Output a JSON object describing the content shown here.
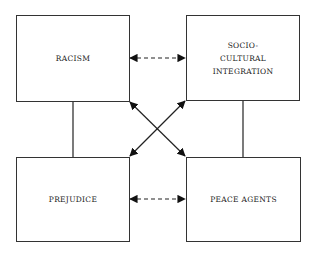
{
  "diagram": {
    "nodes": [
      {
        "id": "racism",
        "label": "RACISM"
      },
      {
        "id": "socio",
        "label_lines": [
          "SOCIO-",
          "CULTURAL",
          "INTEGRATION"
        ]
      },
      {
        "id": "prejudice",
        "label": "PREJUDICE"
      },
      {
        "id": "peace",
        "label": "PEACE AGENTS"
      }
    ],
    "edges": [
      {
        "from": "racism",
        "to": "socio",
        "style": "dashed",
        "arrows": "both"
      },
      {
        "from": "prejudice",
        "to": "peace",
        "style": "dashed",
        "arrows": "both"
      },
      {
        "from": "racism",
        "to": "peace",
        "style": "solid",
        "arrows": "both"
      },
      {
        "from": "socio",
        "to": "prejudice",
        "style": "solid",
        "arrows": "both"
      },
      {
        "from": "racism",
        "to": "prejudice",
        "style": "solid",
        "arrows": "none"
      },
      {
        "from": "socio",
        "to": "peace",
        "style": "solid",
        "arrows": "none"
      }
    ]
  }
}
